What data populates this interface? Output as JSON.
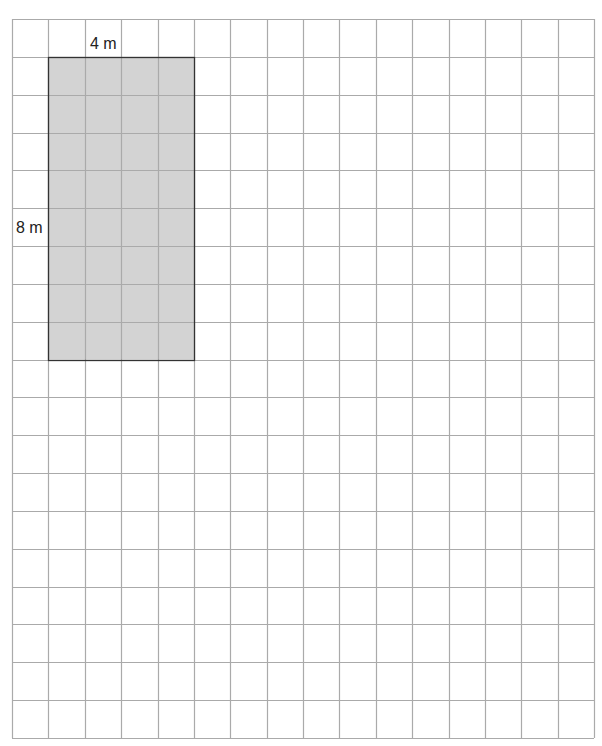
{
  "diagram": {
    "type": "grid-area-rectangle",
    "grid": {
      "columns": 16,
      "rows": 19,
      "origin_x": 12,
      "origin_y": 19,
      "cell_width": 36.375,
      "cell_height": 37.84,
      "line_color": "#aaaaaa"
    },
    "rectangle": {
      "col_start": 1,
      "row_start": 1,
      "width_cells": 4,
      "height_cells": 8,
      "fill_color": "#d3d3d3",
      "border_color": "#333333"
    },
    "labels": {
      "width": "4 m",
      "height": "8 m"
    }
  }
}
